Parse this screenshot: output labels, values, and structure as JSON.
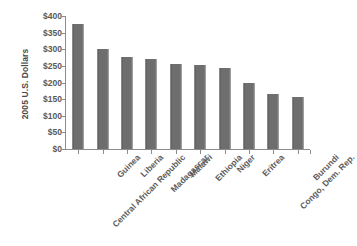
{
  "chart_data": {
    "type": "bar",
    "title": "",
    "subtitle": "",
    "xlabel": "",
    "ylabel": "2005 U.S. Dollars",
    "categories": [
      "Central African Republic",
      "Guinea",
      "Liberia",
      "Madagascar",
      "Malawi",
      "Ethiopia",
      "Niger",
      "Eritrea",
      "Congo, Dem. Rep.",
      "Burundi"
    ],
    "values": [
      376,
      302,
      277,
      272,
      256,
      252,
      245,
      199,
      164,
      156
    ],
    "ylim": [
      0,
      400
    ],
    "ytick_values": [
      0,
      50,
      100,
      150,
      200,
      250,
      300,
      350,
      400
    ],
    "ytick_labels": [
      "$0",
      "$50",
      "$100",
      "$150",
      "$200",
      "$250",
      "$300",
      "$350",
      "$400"
    ],
    "grid": false,
    "legend": false,
    "legend_position": "none",
    "bar_color": "#6e6e6e",
    "axis_color": "#8c8c8c",
    "text_color": "#595959",
    "background": "#ffffff"
  }
}
